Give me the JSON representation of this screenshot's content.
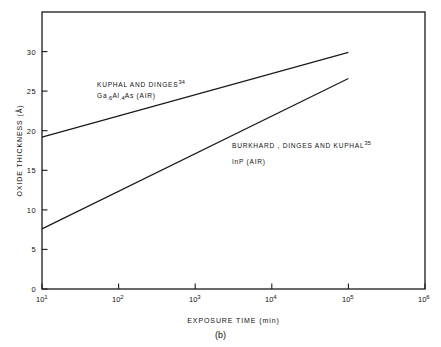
{
  "chart_data": {
    "type": "line",
    "title": "",
    "caption": "(b)",
    "xlabel": "EXPOSURE  TIME (min)",
    "ylabel": "OXIDE  THICKNESS  (Å)",
    "xscale": "log",
    "yscale": "linear",
    "xlim": [
      10,
      1000000
    ],
    "ylim": [
      0,
      35
    ],
    "grid": false,
    "legend_position": "inline-annotations",
    "xtick_labels": [
      "10",
      "10",
      "10",
      "10",
      "10",
      "10"
    ],
    "xtick_exponents": [
      "1",
      "2",
      "3",
      "4",
      "5",
      "6"
    ],
    "xtick_values": [
      10,
      100,
      1000,
      10000,
      100000,
      1000000
    ],
    "ytick_labels": [
      "0",
      "5",
      "10",
      "15",
      "20",
      "25",
      "30"
    ],
    "ytick_values": [
      0,
      5,
      10,
      15,
      20,
      25,
      30
    ],
    "series": [
      {
        "name": "KUPHAL AND DINGES",
        "reference": "34",
        "material": "Ga",
        "material_sub1": ".6",
        "material_mid": "Al",
        "material_sub2": ".4",
        "material_end": "As  (AIR)",
        "x": [
          10,
          100000
        ],
        "y": [
          19.2,
          29.9
        ]
      },
      {
        "name": "BURKHARD, DINGES AND KUPHAL",
        "reference": "35",
        "material": "InP  (AIR)",
        "x": [
          10,
          100000
        ],
        "y": [
          7.6,
          26.6
        ]
      }
    ],
    "annotations": [
      {
        "line1": "KUPHAL  AND  DINGES",
        "line1_sup": "34",
        "line2_prefix": "Ga",
        "line2_sub1": ".6",
        "line2_mid": "Al",
        "line2_sub2": ".4",
        "line2_suffix": "As  (AIR)"
      },
      {
        "line1": "BURKHARD , DINGES  AND  KUPHAL",
        "line1_sup": "35",
        "line2": "InP  (AIR)"
      }
    ],
    "colors": {
      "axis": "#1a1a1a",
      "line": "#1a1a1a",
      "background": "#ffffff"
    }
  }
}
